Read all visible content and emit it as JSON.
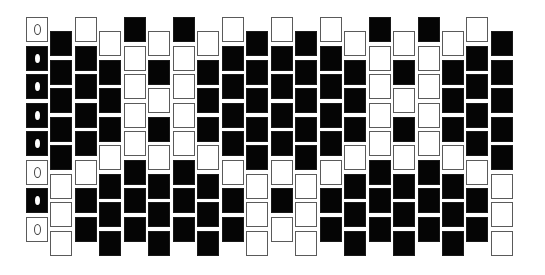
{
  "pattern": {
    "title": "",
    "type": "peyote bead pattern",
    "colors": {
      "B": "#050505",
      "W": "#ffffff",
      "outline": "#5a5a5a"
    },
    "geometry": {
      "origin_x": 26,
      "high_top": 17,
      "low_top": 31,
      "col_pitch": 24.47,
      "row_pitch": 28.5,
      "bead_width": 22,
      "bead_height": 25
    },
    "marker_column": 0,
    "markers": {
      "W": "open-circle",
      "B": "filled-dot"
    },
    "columns": [
      {
        "offset": "high",
        "beads": [
          "W",
          "B",
          "B",
          "B",
          "B",
          "W",
          "B",
          "W"
        ]
      },
      {
        "offset": "low",
        "beads": [
          "B",
          "B",
          "B",
          "B",
          "B",
          "W",
          "W",
          "W"
        ]
      },
      {
        "offset": "high",
        "beads": [
          "W",
          "B",
          "B",
          "B",
          "B",
          "W",
          "B",
          "B"
        ]
      },
      {
        "offset": "low",
        "beads": [
          "W",
          "B",
          "B",
          "B",
          "W",
          "B",
          "B",
          "B"
        ]
      },
      {
        "offset": "high",
        "beads": [
          "B",
          "W",
          "W",
          "W",
          "W",
          "B",
          "B",
          "B"
        ]
      },
      {
        "offset": "low",
        "beads": [
          "W",
          "B",
          "W",
          "B",
          "W",
          "B",
          "B",
          "B"
        ]
      },
      {
        "offset": "high",
        "beads": [
          "B",
          "W",
          "W",
          "W",
          "W",
          "B",
          "B",
          "B"
        ]
      },
      {
        "offset": "low",
        "beads": [
          "W",
          "B",
          "B",
          "B",
          "W",
          "B",
          "B",
          "B"
        ]
      },
      {
        "offset": "high",
        "beads": [
          "W",
          "B",
          "B",
          "B",
          "B",
          "W",
          "B",
          "B"
        ]
      },
      {
        "offset": "low",
        "beads": [
          "B",
          "B",
          "B",
          "B",
          "B",
          "W",
          "W",
          "W"
        ]
      },
      {
        "offset": "high",
        "beads": [
          "W",
          "B",
          "B",
          "B",
          "B",
          "W",
          "B",
          "W"
        ]
      },
      {
        "offset": "low",
        "beads": [
          "B",
          "B",
          "B",
          "B",
          "B",
          "W",
          "W",
          "W"
        ]
      },
      {
        "offset": "high",
        "beads": [
          "W",
          "B",
          "B",
          "B",
          "B",
          "W",
          "B",
          "B"
        ]
      },
      {
        "offset": "low",
        "beads": [
          "W",
          "B",
          "B",
          "B",
          "W",
          "B",
          "B",
          "B"
        ]
      },
      {
        "offset": "high",
        "beads": [
          "B",
          "W",
          "W",
          "W",
          "W",
          "B",
          "B",
          "B"
        ]
      },
      {
        "offset": "low",
        "beads": [
          "W",
          "B",
          "W",
          "B",
          "W",
          "B",
          "B",
          "B"
        ]
      },
      {
        "offset": "high",
        "beads": [
          "B",
          "W",
          "W",
          "W",
          "W",
          "B",
          "B",
          "B"
        ]
      },
      {
        "offset": "low",
        "beads": [
          "W",
          "B",
          "B",
          "B",
          "W",
          "B",
          "B",
          "B"
        ]
      },
      {
        "offset": "high",
        "beads": [
          "W",
          "B",
          "B",
          "B",
          "B",
          "W",
          "B",
          "B"
        ]
      },
      {
        "offset": "low",
        "beads": [
          "B",
          "B",
          "B",
          "B",
          "B",
          "W",
          "W",
          "W"
        ]
      }
    ]
  }
}
